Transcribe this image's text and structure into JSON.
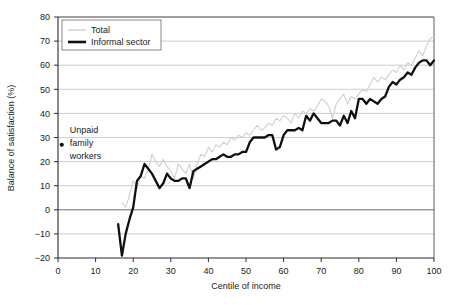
{
  "chart_data": {
    "type": "line",
    "title": "",
    "xlabel": "Centile of income",
    "ylabel": "Balance of satisfaction (%)",
    "xlim": [
      0,
      100
    ],
    "ylim": [
      -20,
      80
    ],
    "xticks": [
      0,
      10,
      20,
      30,
      40,
      50,
      60,
      70,
      80,
      90,
      100
    ],
    "yticks": [
      -20,
      -10,
      0,
      10,
      20,
      30,
      40,
      50,
      60,
      70,
      80
    ],
    "xtick_labels": [
      "0",
      "10",
      "20",
      "30",
      "40",
      "50",
      "60",
      "70",
      "80",
      "90",
      "100"
    ],
    "ytick_labels": [
      "−20",
      "−10",
      "0",
      "10",
      "20",
      "30",
      "40",
      "50",
      "60",
      "70",
      "80"
    ],
    "grid": "horizontal",
    "legend_position": "top-left",
    "series": [
      {
        "name": "Total",
        "color": "#d0d0d0",
        "width": 1.1,
        "x": [
          17,
          18,
          19,
          20,
          21,
          22,
          23,
          24,
          25,
          26,
          27,
          28,
          29,
          30,
          31,
          32,
          33,
          34,
          35,
          36,
          37,
          38,
          39,
          40,
          41,
          42,
          43,
          44,
          45,
          46,
          47,
          48,
          49,
          50,
          51,
          52,
          53,
          54,
          55,
          56,
          57,
          58,
          59,
          60,
          61,
          62,
          63,
          64,
          65,
          66,
          67,
          68,
          69,
          70,
          71,
          72,
          73,
          74,
          75,
          76,
          77,
          78,
          79,
          80,
          81,
          82,
          83,
          84,
          85,
          86,
          87,
          88,
          89,
          90,
          91,
          92,
          93,
          94,
          95,
          96,
          97,
          98,
          99,
          100
        ],
        "values": [
          3,
          1,
          6,
          12,
          9,
          14,
          13,
          17,
          23,
          20,
          18,
          21,
          18,
          16,
          13,
          19,
          17,
          15,
          19,
          13,
          19,
          23,
          22,
          26,
          24,
          27,
          26,
          28,
          27,
          30,
          29,
          31,
          30,
          32,
          31,
          33,
          35,
          33,
          34,
          36,
          35,
          38,
          37,
          39,
          38,
          36,
          40,
          38,
          41,
          40,
          42,
          41,
          43,
          46,
          45,
          43,
          38,
          44,
          46,
          48,
          44,
          47,
          46,
          48,
          50,
          49,
          52,
          55,
          53,
          55,
          54,
          56,
          58,
          57,
          60,
          58,
          61,
          60,
          63,
          66,
          64,
          68,
          71,
          72
        ]
      },
      {
        "name": "Informal sector",
        "color": "#101010",
        "width": 2.3,
        "x": [
          16,
          17,
          18,
          19,
          20,
          21,
          22,
          23,
          24,
          25,
          26,
          27,
          28,
          29,
          30,
          31,
          32,
          33,
          34,
          35,
          36,
          37,
          38,
          39,
          40,
          41,
          42,
          43,
          44,
          45,
          46,
          47,
          48,
          49,
          50,
          51,
          52,
          53,
          54,
          55,
          56,
          57,
          58,
          59,
          60,
          61,
          62,
          63,
          64,
          65,
          66,
          67,
          68,
          69,
          70,
          71,
          72,
          73,
          74,
          75,
          76,
          77,
          78,
          79,
          80,
          81,
          82,
          83,
          84,
          85,
          86,
          87,
          88,
          89,
          90,
          91,
          92,
          93,
          94,
          95,
          96,
          97,
          98,
          99,
          100
        ],
        "values": [
          -6,
          -19,
          -10,
          -4,
          1,
          12,
          14,
          19,
          17,
          15,
          12,
          9,
          11,
          15,
          13,
          12,
          12,
          13,
          13,
          9,
          16,
          17,
          18,
          19,
          20,
          21,
          21,
          22,
          23,
          22,
          22,
          23,
          23,
          24,
          24,
          28,
          30,
          30,
          30,
          30,
          31,
          31,
          25,
          26,
          31,
          33,
          33,
          33,
          34,
          33,
          39,
          37,
          40,
          38,
          36,
          36,
          36,
          37,
          37,
          35,
          39,
          36,
          41,
          38,
          46,
          46,
          44,
          46,
          45,
          44,
          46,
          47,
          51,
          53,
          52,
          54,
          55,
          57,
          56,
          59,
          61,
          62,
          62,
          60,
          62
        ]
      }
    ],
    "annotations": [
      {
        "name": "unpaid-family-workers",
        "lines": [
          "Unpaid",
          "family",
          "workers"
        ],
        "point_x": 1,
        "point_y": 27,
        "marker": "dot"
      }
    ]
  },
  "legend": {
    "items": [
      {
        "label": "Total",
        "color": "#d0d0d0"
      },
      {
        "label": "Informal sector",
        "color": "#101010"
      }
    ]
  }
}
